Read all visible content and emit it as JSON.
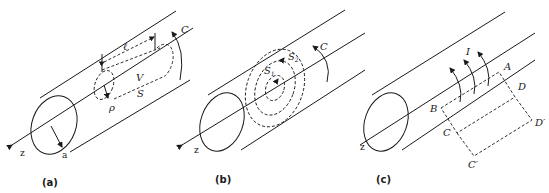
{
  "figure": {
    "panels": [
      {
        "id": "a",
        "caption": "(a)",
        "labels": {
          "axis": "z",
          "radius": "a",
          "inner_radius": "ρ",
          "length": "ℓ",
          "volume": "V",
          "surface": "S",
          "contour": "C"
        }
      },
      {
        "id": "b",
        "caption": "(b)",
        "labels": {
          "axis": "z",
          "surface1": "S",
          "surface1_sub": "1",
          "surface2": "S",
          "surface2_sub": "2",
          "contour": "C"
        }
      },
      {
        "id": "c",
        "caption": "(c)",
        "labels": {
          "axis": "z",
          "current": "I",
          "A": "A",
          "B": "B",
          "C": "C",
          "Cp": "C′",
          "D": "D",
          "Dp": "D′"
        }
      }
    ]
  }
}
